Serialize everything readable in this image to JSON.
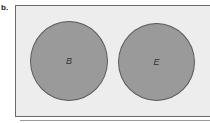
{
  "figure": {
    "label": "b.",
    "universe": {
      "fill": "#ededed",
      "border": "#6a6a6a"
    },
    "sets": [
      {
        "name": "B",
        "fill": "#9a9a9a"
      },
      {
        "name": "E",
        "fill": "#9a9a9a"
      }
    ],
    "relationship": "disjoint"
  }
}
